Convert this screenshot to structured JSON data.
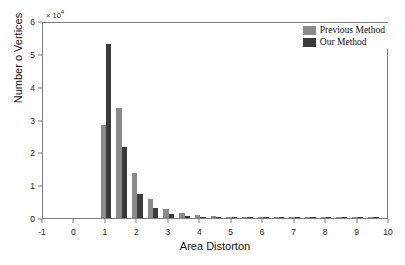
{
  "chart_data": {
    "type": "bar",
    "title": "",
    "xlabel": "Area Distorton",
    "ylabel": "Number o Vertices",
    "y_multiplier": "× 10",
    "y_multiplier_exponent": "4",
    "xlim": [
      -1,
      10
    ],
    "ylim": [
      0,
      6
    ],
    "xticks": [
      -1,
      0,
      1,
      2,
      3,
      4,
      5,
      6,
      7,
      8,
      9,
      10
    ],
    "xtick_labels": [
      "-1",
      "0",
      "1",
      "2",
      "3",
      "4",
      "5",
      "6",
      "7",
      "8",
      "9",
      "10"
    ],
    "yticks": [
      0,
      1,
      2,
      3,
      4,
      5,
      6
    ],
    "ytick_labels": [
      "0",
      "1",
      "2",
      "3",
      "4",
      "5",
      "6"
    ],
    "grid": false,
    "legend_position": "top-right",
    "bar_width": 0.17,
    "x": [
      1.0,
      1.5,
      2.0,
      2.5,
      3.0,
      3.5,
      4.0,
      4.5,
      5.0,
      5.5,
      6.0,
      6.5,
      7.0,
      7.5,
      8.0,
      8.5,
      9.0,
      9.5
    ],
    "series": [
      {
        "name": "Previous Method",
        "color": "#8a8a8a",
        "values": [
          2.82,
          3.34,
          1.37,
          0.58,
          0.26,
          0.14,
          0.08,
          0.05,
          0.035,
          0.02,
          0.015,
          0.01,
          0.008,
          0.006,
          0.005,
          0.004,
          0.003,
          0.003
        ]
      },
      {
        "name": "Our Method",
        "color": "#3b3b3b",
        "values": [
          5.3,
          2.15,
          0.74,
          0.31,
          0.13,
          0.07,
          0.04,
          0.025,
          0.018,
          0.012,
          0.008,
          0.006,
          0.005,
          0.004,
          0.003,
          0.002,
          0.002,
          0.002
        ]
      }
    ]
  },
  "legend": {
    "items": [
      {
        "label": "Previous Method",
        "swatch": "prev"
      },
      {
        "label": "Our Method",
        "swatch": "ours"
      }
    ]
  }
}
